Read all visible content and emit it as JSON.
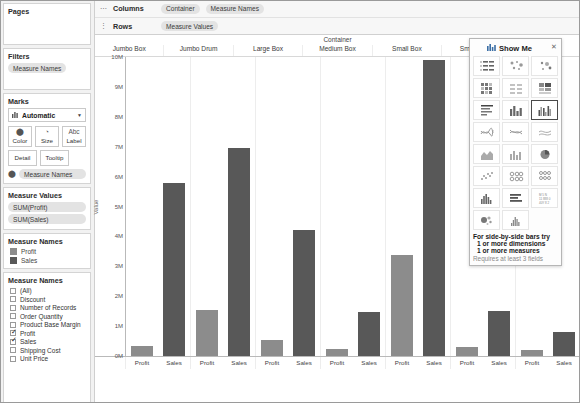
{
  "sidebar": {
    "pages": {
      "title": "Pages"
    },
    "filters": {
      "title": "Filters",
      "items": [
        "Measure Names"
      ]
    },
    "marks": {
      "title": "Marks",
      "type_label": "Automatic",
      "type_icon": "bar-chart-icon",
      "caret": "▼",
      "buttons": [
        {
          "label": "Color",
          "icon": "color-palette-icon",
          "glyph": "⬤"
        },
        {
          "label": "Size",
          "icon": "size-icon",
          "glyph": "◔"
        },
        {
          "label": "Label",
          "icon": "label-icon",
          "glyph": "Abc"
        }
      ],
      "buttons2": [
        {
          "label": "Detail",
          "icon": "detail-icon"
        },
        {
          "label": "Tooltip",
          "icon": "tooltip-icon"
        }
      ],
      "encoding_pill": {
        "label": "Measure Names",
        "icon": "color-encoding-icon",
        "glyph": "⬤"
      }
    },
    "measure_values": {
      "title": "Measure Values",
      "items": [
        "SUM(Profit)",
        "SUM(Sales)"
      ]
    },
    "legend": {
      "title": "Measure Names",
      "items": [
        {
          "label": "Profit",
          "color": "#8c8c8c"
        },
        {
          "label": "Sales",
          "color": "#585858"
        }
      ]
    },
    "filter_list": {
      "title": "Measure Names",
      "items": [
        {
          "label": "(All)",
          "checked": false
        },
        {
          "label": "Discount",
          "checked": false
        },
        {
          "label": "Number of Records",
          "checked": false
        },
        {
          "label": "Order Quantity",
          "checked": false
        },
        {
          "label": "Product Base Margin",
          "checked": false
        },
        {
          "label": "Profit",
          "checked": true
        },
        {
          "label": "Sales",
          "checked": true
        },
        {
          "label": "Shipping Cost",
          "checked": false
        },
        {
          "label": "Unit Price",
          "checked": false
        }
      ]
    }
  },
  "shelves": {
    "columns": {
      "name": "Columns",
      "handle": "⋯",
      "pills": [
        "Container",
        "Measure Names"
      ]
    },
    "rows": {
      "name": "Rows",
      "handle": "⋮",
      "pills": [
        "Measure Values"
      ]
    }
  },
  "showme": {
    "title": "Show Me",
    "icon": "show-me-icon",
    "close": "✕",
    "cells": [
      {
        "name": "text-table-icon",
        "selected": false
      },
      {
        "name": "heat-map-icon",
        "selected": false
      },
      {
        "name": "highlight-table-icon",
        "selected": false
      },
      {
        "name": "symbol-map-icon",
        "selected": false
      },
      {
        "name": "filled-map-icon",
        "selected": false
      },
      {
        "name": "pie-chart-small-icon",
        "selected": false
      },
      {
        "name": "horizontal-bars-icon",
        "selected": false
      },
      {
        "name": "stacked-bars-icon",
        "selected": false
      },
      {
        "name": "side-by-side-bars-icon",
        "selected": true
      },
      {
        "name": "lines-continuous-icon",
        "selected": false
      },
      {
        "name": "lines-discrete-icon",
        "selected": false
      },
      {
        "name": "area-chart-continuous-icon",
        "selected": false
      },
      {
        "name": "area-chart-discrete-icon",
        "selected": false
      },
      {
        "name": "dual-combination-icon",
        "selected": false
      },
      {
        "name": "pie-chart-icon",
        "selected": false
      },
      {
        "name": "scatter-plot-icon",
        "selected": false
      },
      {
        "name": "circle-views-icon",
        "selected": false
      },
      {
        "name": "side-by-side-circle-icon",
        "selected": false
      },
      {
        "name": "histogram-icon",
        "selected": false
      },
      {
        "name": "bullet-graph-icon",
        "selected": false
      },
      {
        "name": "packed-bubbles-text-icon",
        "selected": false
      },
      {
        "name": "packed-bubbles-icon",
        "selected": false
      },
      {
        "name": "histogram-bins-icon",
        "selected": false
      }
    ],
    "footer_line1": "For side-by-side bars try",
    "footer_line2a": "1 or more dimensions",
    "footer_line2b": "1 or more measures",
    "footer_line3": "Requires at least 3 fields"
  },
  "chart_data": {
    "type": "bar",
    "title": "",
    "xlabel": "Container",
    "ylabel": "Value",
    "grid": false,
    "legend_position": "sidebar",
    "ylim": [
      0,
      10000000
    ],
    "ytick_labels": [
      "0M",
      "1M",
      "2M",
      "3M",
      "4M",
      "5M",
      "6M",
      "7M",
      "8M",
      "9M",
      "10M"
    ],
    "ytick_values": [
      0,
      1000000,
      2000000,
      3000000,
      4000000,
      5000000,
      6000000,
      7000000,
      8000000,
      9000000,
      10000000
    ],
    "categories": [
      "Jumbo Box",
      "Jumbo Drum",
      "Large Box",
      "Medium Box",
      "Small Box",
      "Small Pack",
      "Wrap Bag"
    ],
    "measure_labels": [
      "Profit",
      "Sales"
    ],
    "series": [
      {
        "name": "Profit",
        "color": "#8c8c8c",
        "values": [
          330000,
          1530000,
          520000,
          230000,
          3380000,
          290000,
          190000
        ]
      },
      {
        "name": "Sales",
        "color": "#585858",
        "values": [
          5800000,
          6950000,
          4230000,
          1470000,
          9900000,
          1520000,
          800000
        ]
      }
    ]
  }
}
